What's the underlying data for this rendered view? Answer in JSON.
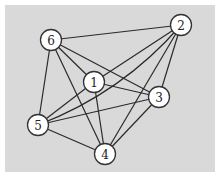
{
  "diagram": {
    "type": "graph",
    "directed": false,
    "nodes": [
      {
        "id": "1",
        "label": "1",
        "x": 94,
        "y": 82
      },
      {
        "id": "2",
        "label": "2",
        "x": 181,
        "y": 25
      },
      {
        "id": "3",
        "label": "3",
        "x": 159,
        "y": 97
      },
      {
        "id": "4",
        "label": "4",
        "x": 105,
        "y": 154
      },
      {
        "id": "5",
        "label": "5",
        "x": 38,
        "y": 125
      },
      {
        "id": "6",
        "label": "6",
        "x": 51,
        "y": 40
      }
    ],
    "edges": [
      {
        "from": "6",
        "to": "2",
        "curved": false
      },
      {
        "from": "6",
        "to": "1",
        "curved": false
      },
      {
        "from": "6",
        "to": "3",
        "curved": false
      },
      {
        "from": "6",
        "to": "4",
        "curved": false
      },
      {
        "from": "6",
        "to": "5",
        "curved": false
      },
      {
        "from": "2",
        "to": "5",
        "curved": true
      },
      {
        "from": "2",
        "to": "1",
        "curved": false
      },
      {
        "from": "2",
        "to": "4",
        "curved": false
      },
      {
        "from": "2",
        "to": "3",
        "curved": false
      },
      {
        "from": "1",
        "to": "5",
        "curved": false
      },
      {
        "from": "1",
        "to": "3",
        "curved": false
      },
      {
        "from": "1",
        "to": "4",
        "curved": false
      },
      {
        "from": "5",
        "to": "3",
        "curved": false
      },
      {
        "from": "5",
        "to": "4",
        "curved": false
      },
      {
        "from": "3",
        "to": "4",
        "curved": false
      }
    ],
    "colors": {
      "background": "#d9d9d9",
      "node_fill": "#ffffff",
      "edge": "#2a2a2a"
    }
  }
}
